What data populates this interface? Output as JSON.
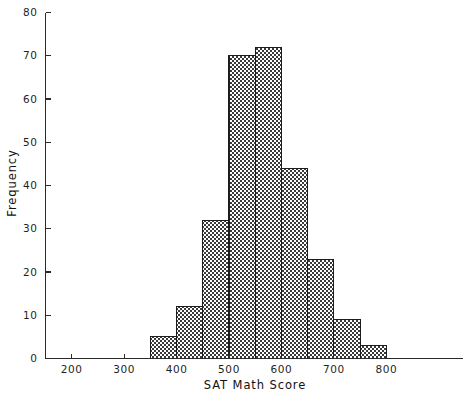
{
  "chart_data": {
    "type": "bar",
    "title": "",
    "xlabel": "SAT Math Score",
    "ylabel": "Frequency",
    "bin_width": 50,
    "bin_edges": [
      350,
      400,
      450,
      500,
      550,
      600,
      650,
      700,
      750,
      800
    ],
    "categories": [
      "350-400",
      "400-450",
      "450-500",
      "500-550",
      "550-600",
      "600-650",
      "650-700",
      "700-750",
      "750-800"
    ],
    "bin_centers": [
      375,
      425,
      475,
      525,
      575,
      625,
      675,
      725,
      775
    ],
    "values": [
      5,
      12,
      32,
      70,
      72,
      44,
      23,
      9,
      3
    ],
    "xlim": [
      150,
      870
    ],
    "ylim": [
      0,
      80
    ],
    "xticks": [
      200,
      300,
      400,
      500,
      600,
      700,
      800
    ],
    "xtick_labels": [
      "200",
      "300",
      "400",
      "500",
      "600",
      "700",
      "800"
    ],
    "yticks": [
      0,
      10,
      20,
      30,
      40,
      50,
      60,
      70,
      80
    ],
    "ytick_labels": [
      "0",
      "10",
      "20",
      "30",
      "40",
      "50",
      "60",
      "70",
      "80"
    ],
    "grid": false,
    "legend": "none",
    "bar_fill": "checkerboard-dither",
    "bar_fill_color": "#3a3a3a",
    "bar_edge_color": "#1c1c1c",
    "axis_color": "#2b2b2b",
    "background_color": "#ffffff"
  },
  "labels": {
    "x_axis_title": "SAT Math Score",
    "y_axis_title": "Frequency"
  }
}
